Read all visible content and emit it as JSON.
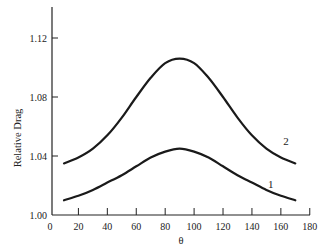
{
  "chart_data": {
    "type": "line",
    "title": "",
    "xlabel": "θ",
    "ylabel": "Relative Drag",
    "xlim": [
      0,
      180
    ],
    "ylim": [
      1.0,
      1.14
    ],
    "xticks": [
      0,
      20,
      40,
      60,
      80,
      100,
      120,
      140,
      160,
      180
    ],
    "xtick_labels": [
      "0",
      "20",
      "40",
      "60",
      "80",
      "100",
      "120",
      "140",
      "160",
      "180"
    ],
    "yticks": [
      1.0,
      1.04,
      1.08,
      1.12
    ],
    "ytick_labels": [
      "1.00",
      "1.04",
      "1.08",
      "1.12"
    ],
    "grid": false,
    "legend": "inline labels near right end of curves",
    "x": [
      10,
      20,
      30,
      40,
      50,
      60,
      70,
      80,
      90,
      100,
      110,
      120,
      130,
      140,
      150,
      160,
      170
    ],
    "series": [
      {
        "name": "1",
        "values": [
          1.01,
          1.013,
          1.017,
          1.022,
          1.027,
          1.033,
          1.039,
          1.043,
          1.045,
          1.043,
          1.039,
          1.033,
          1.027,
          1.022,
          1.017,
          1.013,
          1.01
        ]
      },
      {
        "name": "2",
        "values": [
          1.035,
          1.039,
          1.045,
          1.054,
          1.066,
          1.08,
          1.093,
          1.103,
          1.106,
          1.103,
          1.093,
          1.08,
          1.066,
          1.054,
          1.045,
          1.039,
          1.035
        ]
      }
    ],
    "annotations": [
      {
        "text": "2",
        "x": 158,
        "y": 1.05,
        "series": "2"
      },
      {
        "text": "1",
        "x": 153,
        "y": 1.021,
        "series": "1"
      }
    ]
  }
}
